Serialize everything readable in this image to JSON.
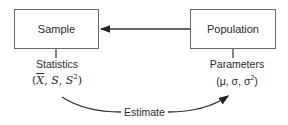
{
  "nodes": {
    "sample": {
      "label": "Sample"
    },
    "population": {
      "label": "Population"
    }
  },
  "annotations": {
    "statistics": {
      "title": "Statistics",
      "open": "(",
      "symbols": [
        "X",
        "S",
        "S"
      ],
      "superscript": "2",
      "sep": ", ",
      "close": ")"
    },
    "parameters": {
      "title": "Parameters",
      "formula": "(μ, σ, σ",
      "superscript": "2",
      "close": ")"
    }
  },
  "edges": {
    "population_to_sample": {
      "from": "Population",
      "to": "Sample"
    },
    "estimate": {
      "label": "Estimate",
      "from": "Statistics",
      "to": "Parameters"
    }
  }
}
